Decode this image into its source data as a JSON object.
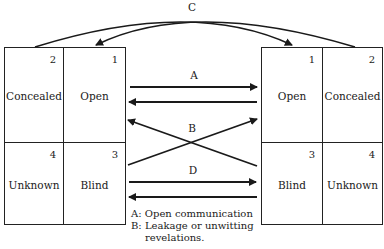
{
  "diagram": {
    "type": "johari-window-communication",
    "top_label": "C",
    "left_window": {
      "cells": [
        {
          "number": "2",
          "label": "Concealed"
        },
        {
          "number": "1",
          "label": "Open"
        },
        {
          "number": "4",
          "label": "Unknown"
        },
        {
          "number": "3",
          "label": "Blind"
        }
      ]
    },
    "right_window": {
      "cells": [
        {
          "number": "1",
          "label": "Open"
        },
        {
          "number": "2",
          "label": "Concealed"
        },
        {
          "number": "3",
          "label": "Blind"
        },
        {
          "number": "4",
          "label": "Unknown"
        }
      ]
    },
    "arrow_labels": {
      "a": "A",
      "b": "B",
      "d": "D"
    },
    "legend": [
      {
        "key": "A:",
        "text": "Open communication"
      },
      {
        "key": "B:",
        "text": "Leakage or unwitting",
        "continuation": "revelations."
      }
    ],
    "line_color": "#1a1a1a"
  }
}
